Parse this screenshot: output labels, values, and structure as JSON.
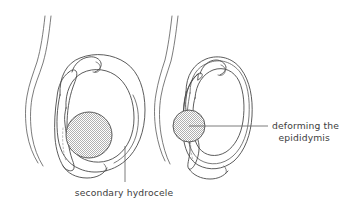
{
  "figure": {
    "title": "secondary hydrocele deforming the epididymis",
    "background_color": "#ffffff",
    "line_color": "#4a4a4a",
    "text_color": "#3d3d3d",
    "stipple_color": "#b4b4b4"
  },
  "labels": {
    "hydrocele": {
      "text": "secondary hydrocele",
      "align": "center"
    },
    "epididymis_line1": {
      "text": "deforming the",
      "align": "left"
    },
    "epididymis_line2": {
      "text": "epididymis",
      "align": "right"
    }
  },
  "panels": [
    {
      "id": "left-panel",
      "name": "scrotum-large-hydrocele",
      "parts": [
        "spermatic-cord",
        "tunica-vaginalis-sac",
        "testis-outline",
        "epididymis-crescent",
        "hydrocele-fluid-disc"
      ]
    },
    {
      "id": "right-panel",
      "name": "scrotum-deformed-epididymis",
      "parts": [
        "spermatic-cord",
        "tunica-vaginalis-sac-double",
        "testis-outline",
        "epididymis-crescent",
        "hydrocele-fluid-disc"
      ]
    }
  ]
}
